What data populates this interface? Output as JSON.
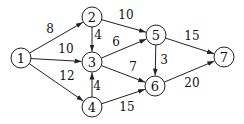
{
  "graph": {
    "node_radius": 10,
    "nodes": [
      {
        "id": "1",
        "label": "1",
        "x": 21,
        "y": 58
      },
      {
        "id": "2",
        "label": "2",
        "x": 92,
        "y": 17
      },
      {
        "id": "3",
        "label": "3",
        "x": 92,
        "y": 62
      },
      {
        "id": "4",
        "label": "4",
        "x": 92,
        "y": 107
      },
      {
        "id": "5",
        "label": "5",
        "x": 156,
        "y": 35
      },
      {
        "id": "6",
        "label": "6",
        "x": 155,
        "y": 86
      },
      {
        "id": "7",
        "label": "7",
        "x": 224,
        "y": 57
      }
    ],
    "edges": [
      {
        "from": "1",
        "to": "2",
        "weight": "8",
        "lx": 50,
        "ly": 29
      },
      {
        "from": "1",
        "to": "3",
        "weight": "10",
        "lx": 66,
        "ly": 49
      },
      {
        "from": "1",
        "to": "4",
        "weight": "12",
        "lx": 67,
        "ly": 76
      },
      {
        "from": "2",
        "to": "3",
        "weight": "4",
        "lx": 98,
        "ly": 35
      },
      {
        "from": "2",
        "to": "5",
        "weight": "10",
        "lx": 126,
        "ly": 15
      },
      {
        "from": "3",
        "to": "5",
        "weight": "6",
        "lx": 116,
        "ly": 42
      },
      {
        "from": "3",
        "to": "6",
        "weight": "7",
        "lx": 133,
        "ly": 67
      },
      {
        "from": "4",
        "to": "3",
        "weight": "4",
        "lx": 97,
        "ly": 86
      },
      {
        "from": "4",
        "to": "6",
        "weight": "15",
        "lx": 127,
        "ly": 107
      },
      {
        "from": "5",
        "to": "6",
        "weight": "3",
        "lx": 164,
        "ly": 60
      },
      {
        "from": "5",
        "to": "7",
        "weight": "15",
        "lx": 192,
        "ly": 36
      },
      {
        "from": "6",
        "to": "7",
        "weight": "20",
        "lx": 192,
        "ly": 83
      }
    ]
  }
}
